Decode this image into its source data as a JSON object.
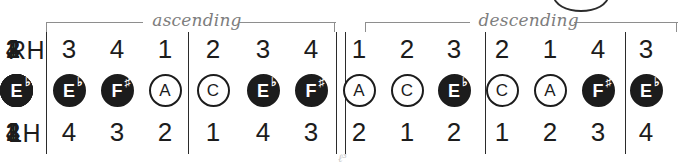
{
  "chart_data": {
    "type": "table",
    "row_labels": {
      "right_hand": "RH",
      "left_hand": "LH"
    },
    "brackets": [
      {
        "label": "ascending",
        "start_px": 46,
        "end_px": 336
      },
      {
        "label": "descending",
        "start_px": 365,
        "end_px": 678
      }
    ],
    "groups": [
      {
        "section": "ascending",
        "columns": [
          {
            "rh": "3",
            "note": "E",
            "accidental": "♭",
            "filled": true,
            "lh": "4"
          },
          {
            "rh": "4",
            "note": "F",
            "accidental": "♯",
            "filled": true,
            "lh": "3"
          },
          {
            "rh": "1",
            "note": "A",
            "accidental": "",
            "filled": false,
            "lh": "2"
          },
          {
            "rh": "2",
            "note": "C",
            "accidental": "",
            "filled": false,
            "lh": "1"
          }
        ]
      },
      {
        "section": "ascending",
        "columns": [
          {
            "rh": "3",
            "note": "E",
            "accidental": "♭",
            "filled": true,
            "lh": "4"
          },
          {
            "rh": "4",
            "note": "F",
            "accidental": "♯",
            "filled": true,
            "lh": "3"
          },
          {
            "rh": "1",
            "note": "A",
            "accidental": "",
            "filled": false,
            "lh": "2"
          },
          {
            "rh": "2",
            "note": "C",
            "accidental": "",
            "filled": false,
            "lh": "1"
          }
        ]
      },
      {
        "section": "descending",
        "columns": [
          {
            "rh": "3",
            "note": "E",
            "accidental": "♭",
            "filled": true,
            "lh": "2"
          },
          {
            "rh": "2",
            "note": "C",
            "accidental": "",
            "filled": false,
            "lh": "1"
          },
          {
            "rh": "1",
            "note": "A",
            "accidental": "",
            "filled": false,
            "lh": "2"
          },
          {
            "rh": "4",
            "note": "F",
            "accidental": "♯",
            "filled": true,
            "lh": "3"
          }
        ]
      },
      {
        "section": "descending",
        "columns": [
          {
            "rh": "3",
            "note": "E",
            "accidental": "♭",
            "filled": true,
            "lh": "4"
          },
          {
            "rh": "2",
            "note": "C",
            "accidental": "",
            "filled": false,
            "lh": "1"
          },
          {
            "rh": "1",
            "note": "A",
            "accidental": "",
            "filled": false,
            "lh": "2"
          },
          {
            "rh": "4",
            "note": "F",
            "accidental": "♯",
            "filled": true,
            "lh": "3"
          }
        ]
      },
      {
        "section": "descending",
        "columns": [
          {
            "rh": "3",
            "note": "E",
            "accidental": "♭",
            "filled": true,
            "lh": "4"
          }
        ]
      }
    ],
    "barlines_px": [
      46,
      188,
      336,
      345,
      485,
      625
    ],
    "colors": {
      "ink": "#1c1c1c",
      "bracket": "#8e8e8e",
      "bracket_text": "#7d7d7d",
      "note_fill": "#1c1c1c",
      "note_text_on_fill": "#ffffff",
      "background": "#ffffff"
    },
    "column_x_px": [
      56,
      104,
      152,
      200,
      250,
      298,
      346,
      394,
      441,
      489,
      537,
      585,
      633
    ],
    "artifact_text": "ℓ³"
  }
}
